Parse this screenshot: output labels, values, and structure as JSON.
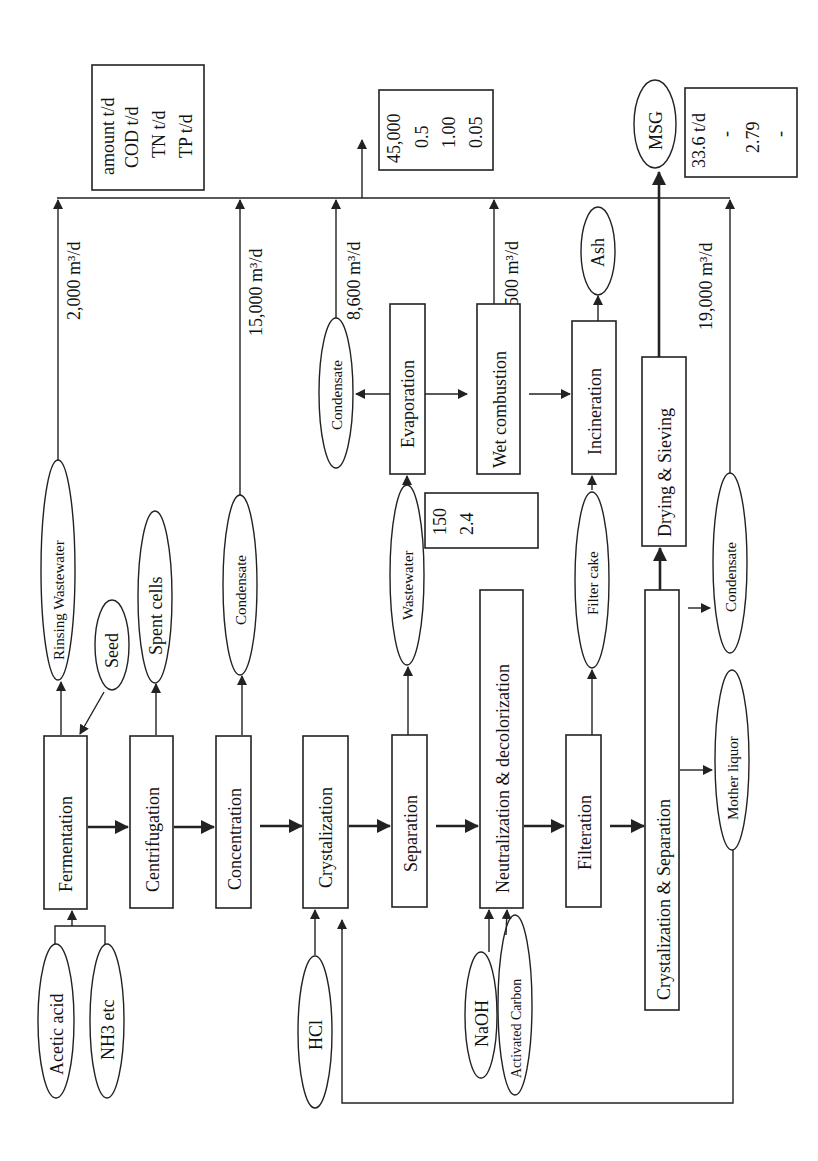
{
  "diagram": {
    "orientation": "rotated 90 degrees counter-clockwise",
    "processes": {
      "fermentation": "Fermentation",
      "centrifugation": "Centrifugation",
      "concentration": "Concentration",
      "crystalization": "Crystalization",
      "separation": "Separation",
      "neutralization": "Neutralization & decolorization",
      "filteration": "Filteration",
      "cryst_sep": "Crystalization & Separation",
      "drying": "Drying & Sieving",
      "evaporation": "Evaporation",
      "wet_combustion": "Wet combustion",
      "incineration": "Incineration"
    },
    "inputs": {
      "acetic_acid": "Acetic acid",
      "nh3": "NH3 etc",
      "seed": "Seed",
      "hcl": "HCl",
      "naoh": "NaOH",
      "activated_carbon": "Activated Carbon",
      "mother_liquor": "Mother liquor"
    },
    "outputs": {
      "rinsing_wastewater": "Rinsing Wastewater",
      "spent_cells": "Spent cells",
      "condensate_1": "Condensate",
      "wastewater": "Wastewater",
      "condensate_evap": "Condensate",
      "filter_cake": "Filter cake",
      "ash": "Ash",
      "condensate_2": "Condensate",
      "msg": "MSG"
    },
    "flows": {
      "rinsing": "2,000 m³/d",
      "concentration": "15,000 m³/d",
      "evaporation_condensate": "8,600 m³/d",
      "wet_combustion": "500 m³/d",
      "final_condensate": "19,000 m³/d"
    },
    "legend": {
      "lines": [
        "amount t/d",
        "COD t/d",
        "TN t/d",
        "TP t/d"
      ]
    },
    "effluent_values": {
      "lines": [
        "45,000",
        "0.5",
        "1.00",
        "0.05"
      ]
    },
    "wastewater_values": {
      "lines": [
        "150",
        "2.4"
      ]
    },
    "msg_values": {
      "lines": [
        "33.6 t/d",
        "-",
        "2.79",
        "-"
      ]
    }
  }
}
